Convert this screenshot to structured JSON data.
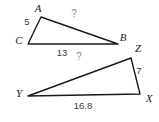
{
  "figure": {
    "background_color": "#ffffff",
    "stroke_color": "#1a1a1a",
    "label_color": "#1a1a1a",
    "measure_color": "#3a3a3a",
    "unknown_color": "#8a8a8a"
  },
  "diagram": {
    "type": "similar-triangles",
    "triangles": [
      {
        "name": "triangle-ABC",
        "vertices": [
          {
            "label": "A",
            "x": 41,
            "y": 17,
            "label_x": 38,
            "label_y": 8
          },
          {
            "label": "B",
            "x": 118,
            "y": 44,
            "label_x": 123,
            "label_y": 37
          },
          {
            "label": "C",
            "x": 28,
            "y": 44,
            "label_x": 19,
            "label_y": 40
          }
        ],
        "side_labels": [
          {
            "name": "side-CA",
            "text": "5",
            "x": 27,
            "y": 22,
            "kind": "measure"
          },
          {
            "name": "side-AB",
            "text": "?",
            "x": 74,
            "y": 14,
            "kind": "unknown"
          },
          {
            "name": "side-CB",
            "text": "13",
            "x": 62,
            "y": 53,
            "kind": "measure"
          }
        ]
      },
      {
        "name": "triangle-XYZ",
        "vertices": [
          {
            "label": "Z",
            "x": 131,
            "y": 58,
            "label_x": 138,
            "label_y": 48
          },
          {
            "label": "X",
            "x": 140,
            "y": 94,
            "label_x": 149,
            "label_y": 98
          },
          {
            "label": "Y",
            "x": 28,
            "y": 96,
            "label_x": 19,
            "label_y": 93
          }
        ],
        "side_labels": [
          {
            "name": "side-ZX",
            "text": "7",
            "x": 139,
            "y": 71,
            "kind": "measure"
          },
          {
            "name": "side-YZ",
            "text": "?",
            "x": 79,
            "y": 57,
            "kind": "unknown"
          },
          {
            "name": "side-YX",
            "text": "16.8",
            "x": 83,
            "y": 106,
            "kind": "measure"
          }
        ]
      }
    ]
  },
  "labels": {
    "A": "A",
    "B": "B",
    "C": "C",
    "X": "X",
    "Y": "Y",
    "Z": "Z",
    "five": "5",
    "thirteen": "13",
    "seven": "7",
    "sixteen_point_eight": "16.8",
    "unknown_upper": "?",
    "unknown_lower": "?"
  }
}
